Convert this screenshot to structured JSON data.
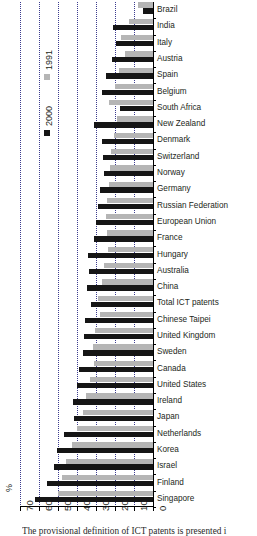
{
  "chart_data": {
    "type": "bar",
    "orientation": "horizontal",
    "title": "",
    "xlabel": "%",
    "ylabel": "",
    "xlim": [
      70,
      0
    ],
    "x_reversed": true,
    "xticks": [
      70,
      60,
      50,
      40,
      30,
      20,
      10,
      0
    ],
    "grid": true,
    "grid_axis": "x",
    "legend_position": "left-inside",
    "legend": [
      "1991",
      "2000"
    ],
    "series": [
      {
        "name": "1991",
        "color": "#b5b5b5",
        "values": [
          8.0,
          12.5,
          17.0,
          15.0,
          18.0,
          20.0,
          23.0,
          19.0,
          20.5,
          22.0,
          22.5,
          23.0,
          24.0,
          24.5,
          24.0,
          23.5,
          26.0,
          27.0,
          29.0,
          28.0,
          30.5,
          31.5,
          31.0,
          33.0,
          35.5,
          37.0,
          40.0,
          42.5,
          46.0,
          48.0,
          50.0
        ]
      },
      {
        "name": "2000",
        "color": "#151515",
        "values": [
          5.5,
          21.0,
          19.5,
          21.5,
          25.0,
          27.0,
          17.5,
          31.0,
          27.0,
          26.5,
          26.0,
          28.0,
          29.0,
          30.0,
          31.0,
          34.0,
          33.5,
          34.5,
          32.5,
          36.0,
          36.5,
          37.0,
          39.0,
          40.0,
          42.0,
          41.5,
          47.0,
          50.5,
          52.0,
          56.0,
          62.0
        ]
      }
    ],
    "categories": [
      "Brazil",
      "India",
      "Italy",
      "Austria",
      "Spain",
      "Belgium",
      "South Africa",
      "New Zealand",
      "Denmark",
      "Switzerland",
      "Norway",
      "Germany",
      "Russian Federation",
      "European Union",
      "France",
      "Hungary",
      "Australia",
      "China",
      "Total ICT patents",
      "Chinese Taipei",
      "United Kingdom",
      "Sweden",
      "Canada",
      "United States",
      "Ireland",
      "Japan",
      "Netherlands",
      "Korea",
      "Israel",
      "Finland",
      "Singapore"
    ]
  },
  "caption": "The provisional definition of ICT patents is presented i"
}
